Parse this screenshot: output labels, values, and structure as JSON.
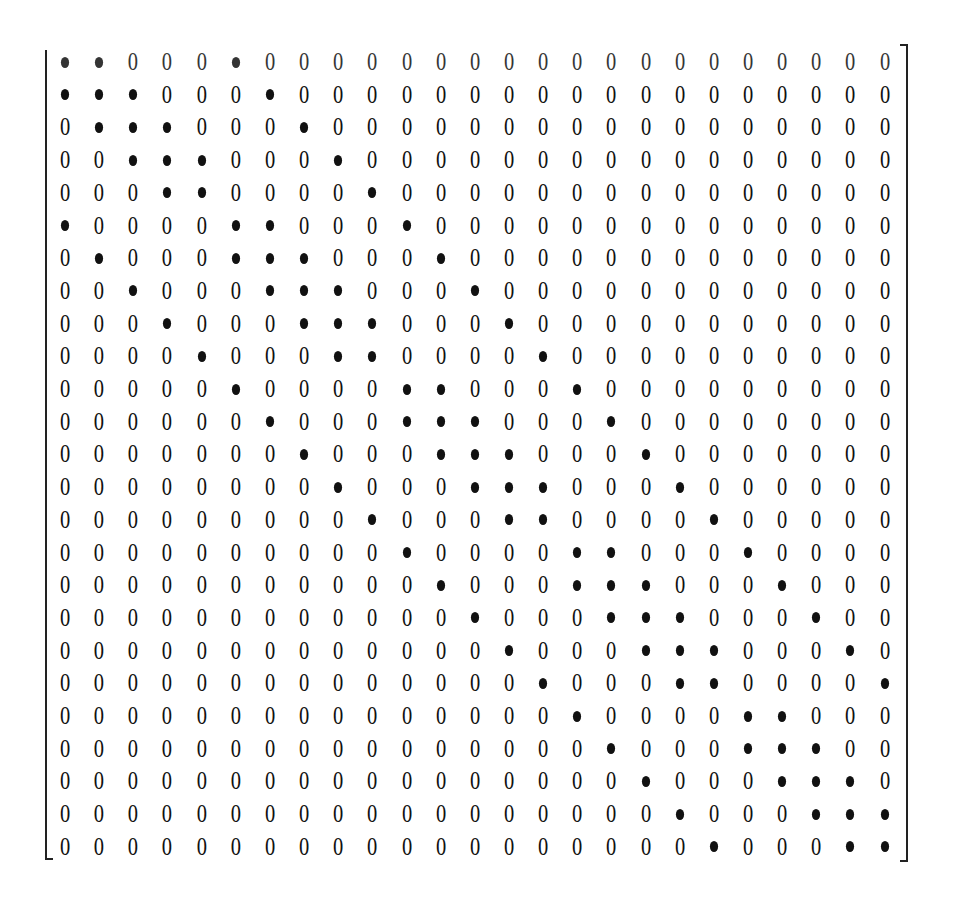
{
  "matrix": {
    "rows": 25,
    "cols": 25,
    "zero_glyph": "0",
    "nonzero_glyph": "•",
    "layout": {
      "origin_x": 65,
      "origin_y": 62,
      "col_step": 34.15,
      "row_step": 32.7
    },
    "nonzero_pattern": [
      [
        0,
        1,
        5
      ],
      [
        0,
        1,
        2,
        6
      ],
      [
        1,
        2,
        3,
        7
      ],
      [
        2,
        3,
        4,
        8
      ],
      [
        3,
        4,
        9
      ],
      [
        0,
        5,
        6,
        10
      ],
      [
        1,
        5,
        6,
        7,
        11
      ],
      [
        2,
        6,
        7,
        8,
        12
      ],
      [
        3,
        7,
        8,
        9,
        13
      ],
      [
        4,
        8,
        9,
        14
      ],
      [
        5,
        10,
        11,
        15
      ],
      [
        6,
        10,
        11,
        12,
        16
      ],
      [
        7,
        11,
        12,
        13,
        17
      ],
      [
        8,
        12,
        13,
        14,
        18
      ],
      [
        9,
        13,
        14,
        19
      ],
      [
        10,
        15,
        16,
        20
      ],
      [
        11,
        15,
        16,
        17,
        21
      ],
      [
        12,
        16,
        17,
        18,
        22
      ],
      [
        13,
        17,
        18,
        19,
        23
      ],
      [
        14,
        18,
        19,
        24
      ],
      [
        15,
        20,
        21
      ],
      [
        16,
        20,
        21,
        22
      ],
      [
        17,
        21,
        22,
        23
      ],
      [
        18,
        22,
        23,
        24
      ],
      [
        19,
        23,
        24
      ]
    ]
  }
}
